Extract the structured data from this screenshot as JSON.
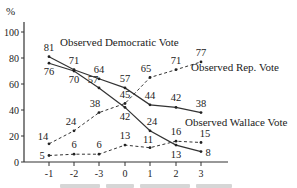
{
  "chart_data": {
    "type": "line",
    "title": "",
    "xlabel": "",
    "ylabel": "%",
    "x": [
      "-1",
      "-2",
      "-3",
      "0",
      "1",
      "2",
      "3"
    ],
    "y_ticks": [
      "0",
      "20",
      "40",
      "60",
      "80",
      "100"
    ],
    "ylim": [
      0,
      100
    ],
    "grid": false,
    "series": [
      {
        "name": "Observed Democratic Vote",
        "style": "solid",
        "values": [
          81,
          71,
          64,
          57,
          44,
          42,
          38
        ]
      },
      {
        "name": "Democratic (second solid series)",
        "style": "solid",
        "values": [
          76,
          70,
          57,
          42,
          24,
          13,
          8
        ]
      },
      {
        "name": "Observed Rep. Vote",
        "style": "dashed",
        "values": [
          14,
          24,
          38,
          45,
          65,
          71,
          77
        ]
      },
      {
        "name": "Observed Wallace Vote",
        "style": "dashed",
        "values": [
          5,
          6,
          6,
          13,
          11,
          16,
          15
        ]
      }
    ],
    "annotations": [
      "Observed Democratic Vote",
      "Observed Rep. Vote",
      "Observed Wallace Vote"
    ]
  },
  "labels": {
    "y_unit": "%",
    "dem": "Observed Democratic Vote",
    "rep": "Observed Rep. Vote",
    "wallace": "Observed Wallace Vote"
  }
}
